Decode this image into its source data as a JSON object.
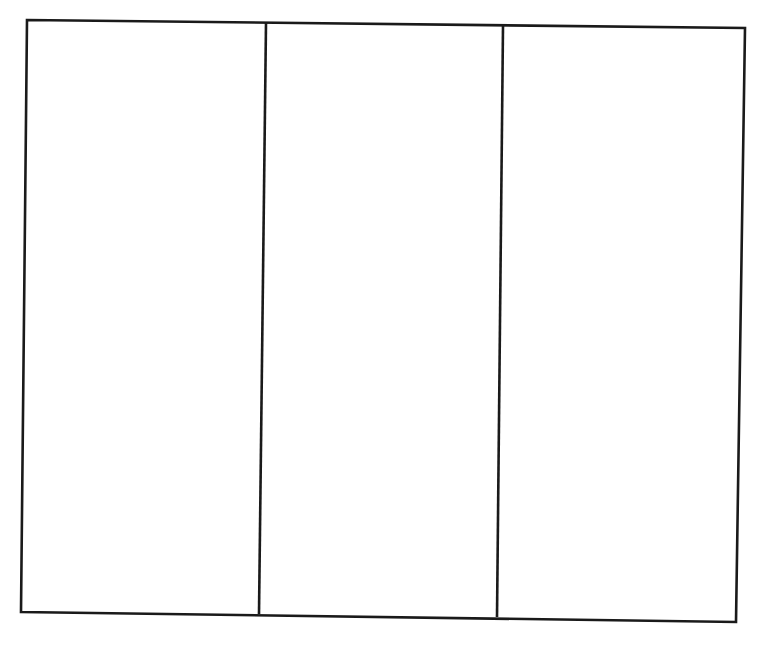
{
  "worksheet": {
    "layout": "three-column blank organizer",
    "column_count": 3,
    "columns": [
      {
        "index": 1,
        "content": ""
      },
      {
        "index": 2,
        "content": ""
      },
      {
        "index": 3,
        "content": ""
      }
    ],
    "line_color": "#1a1a1a",
    "background_color": "#ffffff",
    "outline": {
      "top_left": [
        27,
        20
      ],
      "top_right": [
        745,
        28
      ],
      "bottom_right": [
        736,
        622
      ],
      "bottom_left": [
        21,
        612
      ]
    },
    "dividers": [
      {
        "top": [
          266,
          23
        ],
        "bottom": [
          259,
          614
        ]
      },
      {
        "top": [
          503,
          26
        ],
        "bottom": [
          497,
          617
        ]
      }
    ]
  }
}
